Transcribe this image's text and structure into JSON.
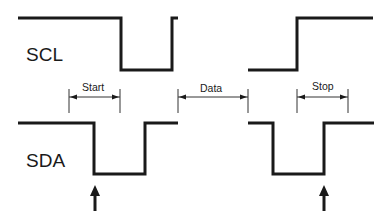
{
  "diagram": {
    "signals": [
      {
        "name": "SCL",
        "label": "SCL"
      },
      {
        "name": "SDA",
        "label": "SDA"
      }
    ],
    "dimensions": [
      {
        "label": "Start"
      },
      {
        "label": "Data"
      },
      {
        "label": "Stop"
      }
    ],
    "colors": {
      "line": "#1a1a1a",
      "background": "#ffffff"
    }
  }
}
